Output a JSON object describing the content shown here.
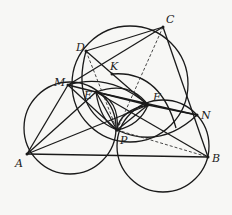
{
  "diagram": {
    "type": "geometry",
    "stroke_color": "#1a1a1a",
    "points": {
      "A": {
        "x": 27,
        "y": 154,
        "label": "A"
      },
      "B": {
        "x": 208,
        "y": 157,
        "label": "B"
      },
      "C": {
        "x": 163,
        "y": 27,
        "label": "C"
      },
      "D": {
        "x": 86,
        "y": 51,
        "label": "D"
      },
      "K": {
        "x": 112,
        "y": 74,
        "label": "K"
      },
      "M": {
        "x": 68,
        "y": 85,
        "label": "M"
      },
      "E": {
        "x": 96,
        "y": 92,
        "label": "E"
      },
      "F": {
        "x": 148,
        "y": 105,
        "label": "F"
      },
      "N": {
        "x": 197,
        "y": 115,
        "label": "N"
      },
      "P": {
        "x": 117,
        "y": 130,
        "label": "P"
      }
    },
    "labels": [
      "A",
      "B",
      "C",
      "D",
      "K",
      "M",
      "E",
      "F",
      "N",
      "P"
    ],
    "segments_solid": [
      [
        "A",
        "B"
      ],
      [
        "A",
        "M"
      ],
      [
        "A",
        "E"
      ],
      [
        "A",
        "F"
      ],
      [
        "B",
        "C"
      ],
      [
        "B",
        "E"
      ],
      [
        "B",
        "N"
      ],
      [
        "C",
        "D"
      ],
      [
        "C",
        "E"
      ],
      [
        "D",
        "F"
      ],
      [
        "M",
        "F"
      ],
      [
        "E",
        "N"
      ],
      [
        "P",
        "N"
      ],
      [
        "M",
        "P"
      ],
      [
        "P",
        "C"
      ]
    ],
    "segments_dashed": [
      [
        "D",
        "P"
      ],
      [
        "P",
        "B"
      ],
      [
        "P",
        "C"
      ]
    ],
    "circles": [
      {
        "name": "circle-AMP",
        "cx": 73,
        "cy": 135,
        "r": 50
      },
      {
        "name": "circle-BNP",
        "cx": 164,
        "cy": 150,
        "r": 45
      },
      {
        "name": "circle-CDP",
        "cx": 134,
        "cy": 90,
        "r": 62
      },
      {
        "name": "circle-KEF",
        "cx": 120,
        "cy": 108,
        "r": 32
      },
      {
        "name": "circle-DMEK",
        "cx": 96,
        "cy": 86,
        "r": 30
      }
    ]
  }
}
